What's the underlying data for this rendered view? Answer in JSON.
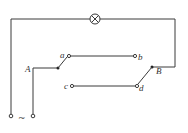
{
  "diagram": {
    "lamp": {
      "symbol": "⊗",
      "name": "lamp"
    },
    "source": {
      "symbol": "~",
      "name": "AC source"
    },
    "switches": [
      {
        "label": "A",
        "contacts": [
          "a",
          "c"
        ],
        "connected_to": "a"
      },
      {
        "label": "B",
        "contacts": [
          "b",
          "d"
        ],
        "connected_to": "d"
      }
    ],
    "contact_labels": {
      "a": "a",
      "b": "b",
      "c": "c",
      "d": "d"
    },
    "wires": [
      "a-b",
      "c-d"
    ]
  }
}
